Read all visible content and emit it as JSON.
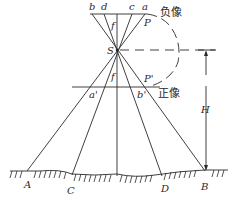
{
  "diagram": {
    "title": "",
    "negative_plane": {
      "label": "负像",
      "plane_label": "P",
      "points": [
        "b",
        "d",
        "c",
        "a"
      ],
      "focal_label": "f"
    },
    "projection_center": {
      "label": "S"
    },
    "positive_plane": {
      "label": "正像",
      "plane_label": "P'",
      "points": [
        "a'",
        "b'"
      ],
      "focal_label": "f"
    },
    "ground_points": [
      "A",
      "C",
      "D",
      "B"
    ],
    "height_label": "H"
  }
}
